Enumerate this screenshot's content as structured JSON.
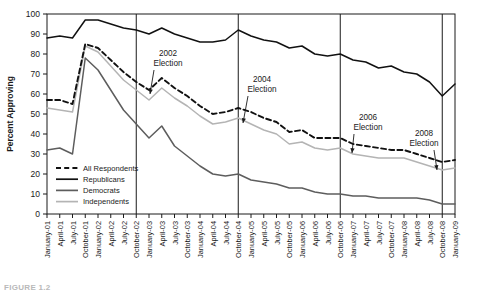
{
  "figure": {
    "caption": "FIGURE 1.2",
    "background": "#ffffff",
    "ink": "#1a1a1a"
  },
  "chart_data": {
    "type": "line",
    "title": "",
    "xlabel": "",
    "ylabel": "Percent Approving",
    "ylim": [
      0,
      100
    ],
    "ytick_step": 10,
    "yticks": [
      0,
      10,
      20,
      30,
      40,
      50,
      60,
      70,
      80,
      90,
      100
    ],
    "grid": false,
    "legend_position": "inside-lower-left",
    "categories": [
      "January-01",
      "April-01",
      "July-01",
      "October-01",
      "January-02",
      "April-02",
      "July-02",
      "October-02",
      "January-03",
      "April-03",
      "July-03",
      "October-03",
      "January-04",
      "April-04",
      "July-04",
      "October-04",
      "January-05",
      "April-05",
      "July-05",
      "October-05",
      "January-06",
      "April-06",
      "July-06",
      "October-06",
      "January-07",
      "April-07",
      "July-07",
      "October-07",
      "January-08",
      "April-08",
      "July-08",
      "October-08",
      "January-09"
    ],
    "series": [
      {
        "name": "All Respondents",
        "style": "dashed",
        "color": "#111111",
        "width": 1.9,
        "values": [
          57,
          57,
          55,
          85,
          83,
          77,
          71,
          66,
          62,
          68,
          63,
          59,
          54,
          50,
          51,
          53,
          51,
          48,
          46,
          41,
          42,
          38,
          38,
          38,
          35,
          34,
          33,
          32,
          32,
          30,
          28,
          26,
          27
        ]
      },
      {
        "name": "Republicans",
        "style": "solid",
        "color": "#111111",
        "width": 1.5,
        "values": [
          88,
          89,
          88,
          97,
          97,
          95,
          93,
          92,
          90,
          93,
          90,
          88,
          86,
          86,
          87,
          92,
          89,
          87,
          86,
          83,
          84,
          80,
          79,
          80,
          77,
          76,
          73,
          74,
          71,
          70,
          66,
          59,
          65
        ]
      },
      {
        "name": "Democrats",
        "style": "solid",
        "color": "#5d5d5d",
        "width": 1.5,
        "values": [
          32,
          33,
          30,
          78,
          72,
          62,
          52,
          45,
          38,
          44,
          34,
          29,
          24,
          20,
          19,
          20,
          17,
          16,
          15,
          13,
          13,
          11,
          10,
          10,
          9,
          9,
          8,
          8,
          8,
          8,
          7,
          5,
          5
        ]
      },
      {
        "name": "Independents",
        "style": "solid",
        "color": "#b4b4b4",
        "width": 1.5,
        "values": [
          53,
          52,
          51,
          84,
          81,
          74,
          67,
          62,
          57,
          63,
          58,
          54,
          49,
          45,
          46,
          48,
          45,
          42,
          40,
          35,
          36,
          33,
          32,
          33,
          30,
          29,
          28,
          28,
          28,
          26,
          24,
          22,
          23
        ]
      }
    ],
    "annotations": [
      {
        "label_line1": "2002",
        "label_line2": "Election",
        "x_category": "October-02"
      },
      {
        "label_line1": "2004",
        "label_line2": "Election",
        "x_category": "October-04"
      },
      {
        "label_line1": "2006",
        "label_line2": "Election",
        "x_category": "October-06"
      },
      {
        "label_line1": "2008",
        "label_line2": "Election",
        "x_category": "October-08"
      }
    ],
    "vertical_rules": [
      "October-02",
      "October-04",
      "October-06",
      "October-08"
    ]
  }
}
